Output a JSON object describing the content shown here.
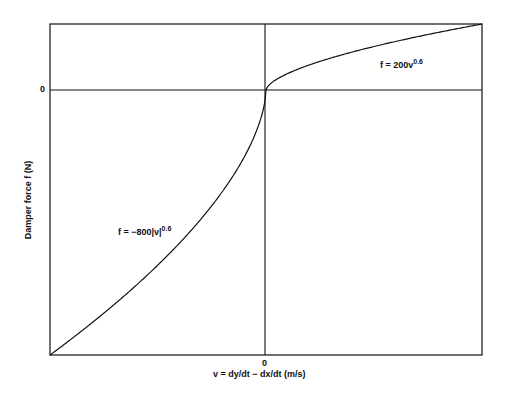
{
  "chart_data": {
    "type": "line",
    "title": "",
    "xlabel": "v = dy/dt − dx/dt   (m/s)",
    "ylabel": "Damper force f (N)",
    "x_ticks": [
      "0"
    ],
    "y_ticks": [
      "0"
    ],
    "xlim": [
      -1,
      1
    ],
    "ylim": [
      -800,
      200
    ],
    "grid": false,
    "legend": null,
    "series": [
      {
        "name": "f = 200v^0.6",
        "domain": "v >= 0",
        "x": [
          0,
          0.05,
          0.1,
          0.2,
          0.3,
          0.4,
          0.5,
          0.6,
          0.7,
          0.8,
          0.9,
          1.0
        ],
        "values": [
          0,
          33.1,
          50.2,
          76.1,
          97.3,
          115.8,
          132.0,
          147.0,
          161.0,
          174.9,
          187.7,
          200
        ]
      },
      {
        "name": "f = -800|v|^0.6",
        "domain": "v <= 0",
        "x": [
          -1.0,
          -0.9,
          -0.8,
          -0.7,
          -0.6,
          -0.5,
          -0.4,
          -0.3,
          -0.2,
          -0.1,
          -0.05,
          0
        ],
        "values": [
          -800,
          -750.9,
          -699.4,
          -644.0,
          -588.2,
          -527.9,
          -463.2,
          -389.2,
          -304.4,
          -200.9,
          -132.6,
          0
        ]
      }
    ],
    "annotations": [
      {
        "text": "f = 200v",
        "sup": "0.6",
        "near": "upper-right branch"
      },
      {
        "text": "f = −800|v|",
        "sup": "0.6",
        "near": "lower-left branch"
      }
    ]
  },
  "labels": {
    "x_zero": "0",
    "y_zero": "0",
    "xlabel": "v = dy/dt − dx/dt   (m/s)",
    "ylabel": "Damper force f (N)",
    "pos_eq_main": "f = 200v",
    "pos_eq_sup": "0.6",
    "neg_eq_main": "f = −800|v|",
    "neg_eq_sup": "0.6"
  }
}
